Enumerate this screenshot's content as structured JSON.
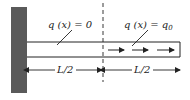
{
  "diagram": {
    "colors": {
      "wall": "#5a5a5a",
      "line": "#222222",
      "background": "#ffffff"
    },
    "labels": {
      "left_load": "q (x) = 0",
      "right_load_prefix": "q (x) = q",
      "right_load_subscript": "0",
      "left_length": "L/2",
      "right_length": "L/2"
    },
    "load_arrows": {
      "count": 3,
      "direction": "right"
    }
  }
}
